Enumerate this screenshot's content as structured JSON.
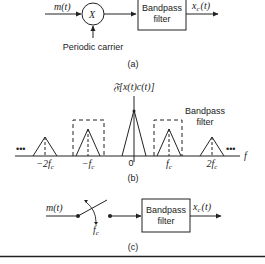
{
  "panel_a": {
    "input_label": "m(t)",
    "multiplier_symbol": "X",
    "carrier_label": "Periodic carrier",
    "filter_line1": "Bandpass",
    "filter_line2": "filter",
    "output_label_main": "x",
    "output_label_sub": "c",
    "output_label_arg": "(t)",
    "caption": "(a)"
  },
  "panel_b": {
    "title": "𝔉[x(t)c(t)]",
    "axis_label": "f",
    "ellipsis_left": "•••",
    "ellipsis_right": "•••",
    "filter_line1": "Bandpass",
    "filter_line2": "filter",
    "ticks": [
      "−2f",
      "−f",
      "0",
      "f",
      "2f"
    ],
    "tick_sub": "c",
    "caption": "(b)"
  },
  "panel_c": {
    "input_label": "m(t)",
    "switch_rate_main": "f",
    "switch_rate_sub": "c",
    "filter_line1": "Bandpass",
    "filter_line2": "filter",
    "output_label_main": "x",
    "output_label_sub": "c",
    "output_label_arg": "(t)",
    "caption": "(c)"
  },
  "colors": {
    "ink": "#222222",
    "background": "#ffffff"
  }
}
